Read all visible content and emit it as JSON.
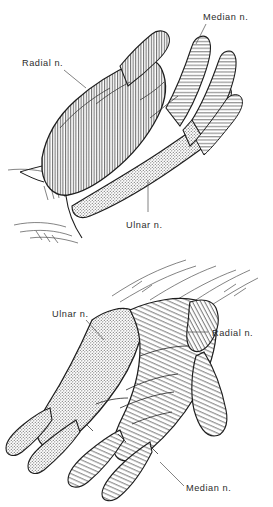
{
  "figure": {
    "background_color": "#ffffff",
    "ink_color": "#2b2b2b",
    "panels": [
      {
        "name": "dorsal-view",
        "view_label": "dorsum of hand",
        "labels": [
          {
            "id": "radial-top",
            "text": "Radial n.",
            "x": 22,
            "y": 66,
            "anchor": "start"
          },
          {
            "id": "median-top",
            "text": "Median n.",
            "x": 203,
            "y": 20,
            "anchor": "start"
          },
          {
            "id": "ulnar-top",
            "text": "Ulnar n.",
            "x": 126,
            "y": 221,
            "anchor": "start"
          }
        ]
      },
      {
        "name": "palmar-view",
        "view_label": "palm of hand",
        "labels": [
          {
            "id": "ulnar-bottom",
            "text": "Ulnar n.",
            "x": 54,
            "y": 314,
            "anchor": "start"
          },
          {
            "id": "radial-bottom",
            "text": "Radial n.",
            "x": 212,
            "y": 335,
            "anchor": "start"
          },
          {
            "id": "median-bottom",
            "text": "Median n.",
            "x": 186,
            "y": 489,
            "anchor": "start"
          }
        ]
      }
    ],
    "territories": [
      {
        "nerve": "Radial n.",
        "pattern": "vertical-hatch",
        "tone": "#dcdcdc"
      },
      {
        "nerve": "Median n.",
        "pattern": "diagonal-hatch",
        "tone": "#e2e2e2"
      },
      {
        "nerve": "Ulnar n.",
        "pattern": "stipple",
        "tone": "#c9c9c9"
      }
    ]
  }
}
